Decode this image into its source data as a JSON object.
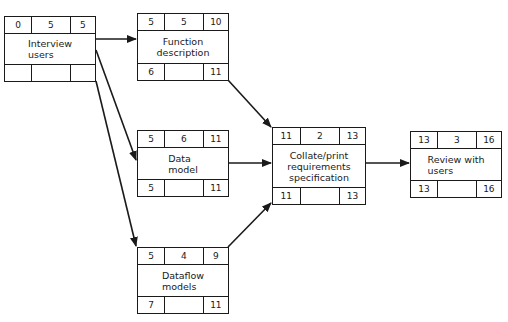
{
  "diagram": {
    "type": "activity-network",
    "nodes": [
      {
        "id": "interview",
        "label": "Interview\nusers",
        "earliest_start": "0",
        "duration": "5",
        "earliest_finish": "5",
        "latest_start": "",
        "float": "",
        "latest_finish": ""
      },
      {
        "id": "function",
        "label": "Function\ndescription",
        "earliest_start": "5",
        "duration": "5",
        "earliest_finish": "10",
        "latest_start": "6",
        "float": "",
        "latest_finish": "11"
      },
      {
        "id": "datamodel",
        "label": "Data\nmodel",
        "earliest_start": "5",
        "duration": "6",
        "earliest_finish": "11",
        "latest_start": "5",
        "float": "",
        "latest_finish": "11"
      },
      {
        "id": "dataflow",
        "label": "Dataflow\nmodels",
        "earliest_start": "5",
        "duration": "4",
        "earliest_finish": "9",
        "latest_start": "7",
        "float": "",
        "latest_finish": "11"
      },
      {
        "id": "collate",
        "label": "Collate/print\nrequirements\nspecification",
        "earliest_start": "11",
        "duration": "2",
        "earliest_finish": "13",
        "latest_start": "11",
        "float": "",
        "latest_finish": "13"
      },
      {
        "id": "review",
        "label": "Review with\nusers",
        "earliest_start": "13",
        "duration": "3",
        "earliest_finish": "16",
        "latest_start": "13",
        "float": "",
        "latest_finish": "16"
      }
    ],
    "edges": [
      {
        "from": "interview",
        "to": "function"
      },
      {
        "from": "interview",
        "to": "datamodel"
      },
      {
        "from": "interview",
        "to": "dataflow"
      },
      {
        "from": "function",
        "to": "collate"
      },
      {
        "from": "datamodel",
        "to": "collate"
      },
      {
        "from": "dataflow",
        "to": "collate"
      },
      {
        "from": "collate",
        "to": "review"
      }
    ],
    "colors": {
      "line": "#1a1a1a",
      "background": "#ffffff"
    }
  }
}
